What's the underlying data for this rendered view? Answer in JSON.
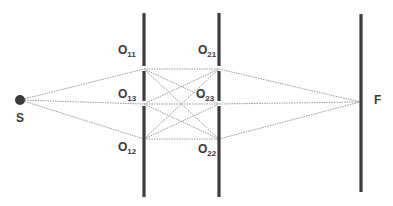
{
  "diagram": {
    "title": "",
    "source": {
      "label": "S",
      "x": 20,
      "y": 100
    },
    "screen": {
      "label": "F",
      "x": 361,
      "y_top": 14,
      "y_bottom": 192,
      "focus_y": 102
    },
    "barrier1": {
      "x": 144,
      "segments": [
        [
          13,
          66
        ],
        [
          71,
          101
        ],
        [
          106,
          197
        ]
      ],
      "slits": [
        {
          "name": "O11",
          "base": "O",
          "sub": "11",
          "y": 69
        },
        {
          "name": "O13",
          "base": "O",
          "sub": "13",
          "y": 104
        },
        {
          "name": "O12",
          "base": "O",
          "sub": "12",
          "y": 139
        }
      ]
    },
    "barrier2": {
      "x": 219,
      "segments": [
        [
          13,
          66
        ],
        [
          71,
          101
        ],
        [
          106,
          197
        ]
      ],
      "slits": [
        {
          "name": "O21",
          "base": "O",
          "sub": "21",
          "y": 69
        },
        {
          "name": "O23",
          "base": "O",
          "sub": "23",
          "y": 104
        },
        {
          "name": "O22",
          "base": "O",
          "sub": "22",
          "y": 139
        }
      ]
    },
    "labels": {
      "S": "S",
      "F": "F",
      "O11": {
        "base": "O",
        "sub": "11"
      },
      "O13": {
        "base": "O",
        "sub": "13"
      },
      "O12": {
        "base": "O",
        "sub": "12"
      },
      "O21": {
        "base": "O",
        "sub": "21"
      },
      "O23": {
        "base": "O",
        "sub": "23"
      },
      "O22": {
        "base": "O",
        "sub": "22"
      }
    },
    "colors": {
      "bar": "#3d3d3d",
      "ray": "#9a9a9a",
      "text": "#3a3a3a"
    }
  }
}
